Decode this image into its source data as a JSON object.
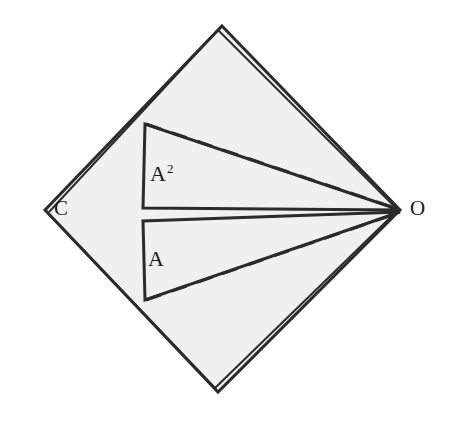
{
  "figure": {
    "background_color": "#ffffff",
    "fill_color": "#f0f0f0",
    "stroke_color": "#2b2b2b",
    "canvas": {
      "width": 450,
      "height": 425
    }
  },
  "vertices": [
    {
      "name": "top",
      "label": "",
      "x": 222,
      "y": 26
    },
    {
      "name": "right",
      "label": "O",
      "x": 400,
      "y": 210
    },
    {
      "name": "bottom",
      "label": "",
      "x": 218,
      "y": 392
    },
    {
      "name": "left",
      "label": "C",
      "x": 45,
      "y": 210
    }
  ],
  "labels": {
    "vertex_left": "C",
    "vertex_right": "O",
    "region_upper_base": "A",
    "region_upper_exponent": "2",
    "region_lower": "A"
  },
  "shapes": {
    "rhombus": {
      "name": "outer-rhombus",
      "points": "222,26 400,210 218,392 45,210",
      "fill": "#f0f0f0",
      "stroke": "#2b2b2b"
    },
    "upper_triangle": {
      "name": "upper-triangle-A-squared",
      "apex": {
        "x": 145,
        "y": 124
      },
      "corner": {
        "x": 143,
        "y": 208
      },
      "tip": {
        "x": 400,
        "y": 210
      },
      "points": "145,124 143,208 400,210"
    },
    "lower_triangle": {
      "name": "lower-triangle-A",
      "corner": {
        "x": 143,
        "y": 221
      },
      "base": {
        "x": 145,
        "y": 300
      },
      "tip": {
        "x": 400,
        "y": 212
      },
      "points": "143,221 145,300 400,212"
    }
  },
  "dashed_lines": [
    {
      "name": "upper-dashed-apex-to-O",
      "x1": 146,
      "y1": 124,
      "x2": 398,
      "y2": 209
    },
    {
      "name": "lower-dashed-base-to-O",
      "x1": 146,
      "y1": 300,
      "x2": 398,
      "y2": 213
    }
  ]
}
